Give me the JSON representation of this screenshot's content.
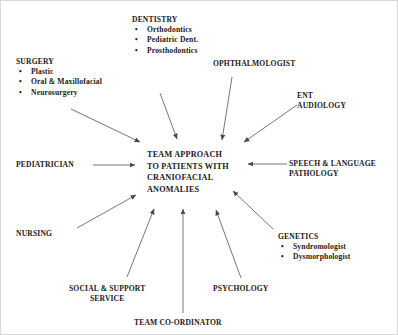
{
  "diagram": {
    "title": "TEAM APPROACH TO PATIENTS WITH CRANIOFACIAL ANOMALIES",
    "center": {
      "line1": "TEAM APPROACH",
      "line2": "TO PATIENTS WITH",
      "line3": "CRANIOFACIAL",
      "line4": "ANOMALIES"
    },
    "nodes": {
      "dentistry": {
        "heading": "DENTISTRY",
        "items": [
          "Orthodontics",
          "Pediatric Dent.",
          "Prosthodontics"
        ]
      },
      "surgery": {
        "heading": "SURGERY",
        "items": [
          "Plastic",
          "Oral & Maxillofacial",
          "Neurosurgery"
        ]
      },
      "ophthalmologist": {
        "heading": "OPHTHALMOLOGIST"
      },
      "ent_audiology": {
        "line1": "ENT",
        "line2": "AUDIOLOGY"
      },
      "pediatrician": {
        "heading": "PEDIATRICIAN"
      },
      "speech_language_pathology": {
        "line1": "SPEECH  & LANGUAGE",
        "line2": "PATHOLOGY"
      },
      "nursing": {
        "heading": "NURSING"
      },
      "genetics": {
        "heading": "GENETICS",
        "items": [
          "Syndromologist",
          "Dysmorphologist"
        ]
      },
      "social_support_service": {
        "line1": "SOCIAL & SUPPORT",
        "line2": "SERVICE"
      },
      "psychology": {
        "heading": "PSYCHOLOGY"
      },
      "team_coordinator": {
        "heading": "TEAM CO-ORDINATOR"
      }
    },
    "bullet_glyph": "•",
    "colors": {
      "background": "#ffffff",
      "text": "#1a1a1a",
      "arrow": "#555555",
      "border": "#d8d8d8"
    }
  }
}
